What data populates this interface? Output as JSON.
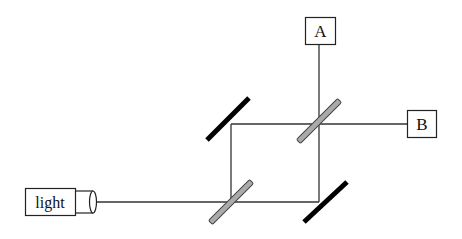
{
  "diagram": {
    "type": "Mach-Zehnder interferometer",
    "source": {
      "label": "light"
    },
    "detectors": [
      {
        "id": "A",
        "label": "A"
      },
      {
        "id": "B",
        "label": "B"
      }
    ],
    "components": {
      "beam_splitters": 2,
      "mirrors": 2
    },
    "colors": {
      "line": "#333333",
      "mirror": "#000000",
      "beam_splitter_fill": "#aaaaaa",
      "beam_splitter_stroke": "#444444",
      "box_stroke": "#222222"
    }
  }
}
